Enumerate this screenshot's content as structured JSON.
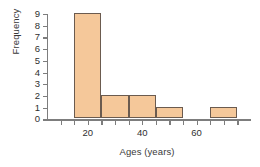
{
  "chart_data": {
    "type": "bar",
    "title": "",
    "xlabel": "Ages (years)",
    "ylabel": "Frequency",
    "xlim": [
      5,
      80
    ],
    "ylim": [
      0,
      9
    ],
    "grid": false,
    "legend": "none",
    "bin_width": 10,
    "bin_edges": [
      15,
      25,
      35,
      45,
      55,
      65,
      75
    ],
    "categories": [
      "15-25",
      "25-35",
      "35-45",
      "45-55",
      "55-65",
      "65-75"
    ],
    "values": [
      9,
      2,
      2,
      1,
      0,
      1
    ],
    "bar_fill_color": "#F5C89A",
    "bar_edge_color": "#6B5B4F",
    "axis_color": "#7D7D7D",
    "background_color": "#FFFFFF",
    "x_tick_labels": [
      "20",
      "40",
      "60"
    ],
    "x_tick_values": [
      20,
      40,
      60
    ],
    "x_minor_tick_values": [
      10,
      15,
      25,
      30,
      35,
      45,
      50,
      55,
      65,
      70,
      75
    ],
    "y_tick_labels": [
      "0",
      "1",
      "2",
      "3",
      "4",
      "5",
      "6",
      "7",
      "8",
      "9"
    ],
    "y_tick_values": [
      0,
      1,
      2,
      3,
      4,
      5,
      6,
      7,
      8,
      9
    ]
  }
}
